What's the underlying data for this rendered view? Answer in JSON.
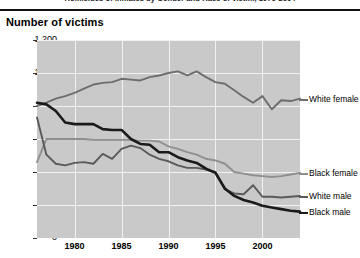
{
  "document": {
    "title": "Homicides of inmates by Gender and Race of victim, 1970-2004",
    "axis_header": "Number of victims"
  },
  "colors": {
    "plot_background": "#c9c9c9",
    "gridline": "#f2f2f2",
    "white_female": "#6e6e6e",
    "black_female": "#8f8f8f",
    "white_male": "#5a5a5a",
    "black_male": "#1a1a1a"
  },
  "legend": [
    {
      "label": "White female",
      "color": "#6e6e6e"
    },
    {
      "label": "Black female",
      "color": "#8f8f8f"
    },
    {
      "label": "White male",
      "color": "#5a5a5a"
    },
    {
      "label": "Black male",
      "color": "#1a1a1a"
    }
  ],
  "chart_data": {
    "type": "line",
    "title": "Homicides of inmates by Gender and Race of victim, 1970-2004",
    "xlabel": "",
    "ylabel": "Number of victims",
    "ylim": [
      0,
      1200
    ],
    "yticks": [
      0,
      200,
      400,
      600,
      800,
      1000,
      1200
    ],
    "ytick_labels": [
      "0",
      "200",
      "400",
      "600",
      "800",
      "1,000",
      "1,200"
    ],
    "xlim": [
      1976,
      2004
    ],
    "xticks": [
      1980,
      1985,
      1990,
      1995,
      2000
    ],
    "xtick_labels": [
      "1980",
      "1985",
      "1990",
      "1995",
      "2000"
    ],
    "grid": true,
    "legend_position": "right-inline",
    "x": [
      1976,
      1977,
      1978,
      1979,
      1980,
      1981,
      1982,
      1983,
      1984,
      1985,
      1986,
      1987,
      1988,
      1989,
      1990,
      1991,
      1992,
      1993,
      1994,
      1995,
      1996,
      1997,
      1998,
      1999,
      2000,
      2001,
      2002,
      2003,
      2004
    ],
    "series": [
      {
        "name": "White female",
        "color": "#6e6e6e",
        "values": [
          800,
          820,
          845,
          860,
          880,
          905,
          930,
          940,
          945,
          965,
          960,
          955,
          975,
          985,
          1000,
          1010,
          985,
          1010,
          975,
          945,
          935,
          895,
          855,
          820,
          860,
          780,
          835,
          830,
          845
        ]
      },
      {
        "name": "Black female",
        "color": "#8f8f8f",
        "values": [
          460,
          600,
          600,
          600,
          600,
          600,
          595,
          595,
          595,
          595,
          595,
          590,
          590,
          585,
          555,
          540,
          520,
          505,
          480,
          470,
          450,
          400,
          390,
          380,
          375,
          370,
          375,
          385,
          395
        ]
      },
      {
        "name": "White male",
        "color": "#5a5a5a",
        "values": [
          730,
          505,
          450,
          440,
          455,
          460,
          450,
          510,
          480,
          540,
          560,
          545,
          505,
          480,
          465,
          440,
          425,
          425,
          415,
          400,
          295,
          270,
          265,
          320,
          250,
          250,
          245,
          250,
          255
        ]
      },
      {
        "name": "Black male",
        "color": "#1a1a1a",
        "values": [
          820,
          810,
          770,
          700,
          690,
          690,
          690,
          660,
          655,
          655,
          600,
          570,
          565,
          520,
          520,
          490,
          470,
          455,
          420,
          395,
          300,
          255,
          230,
          215,
          195,
          185,
          175,
          165,
          160
        ]
      }
    ]
  }
}
